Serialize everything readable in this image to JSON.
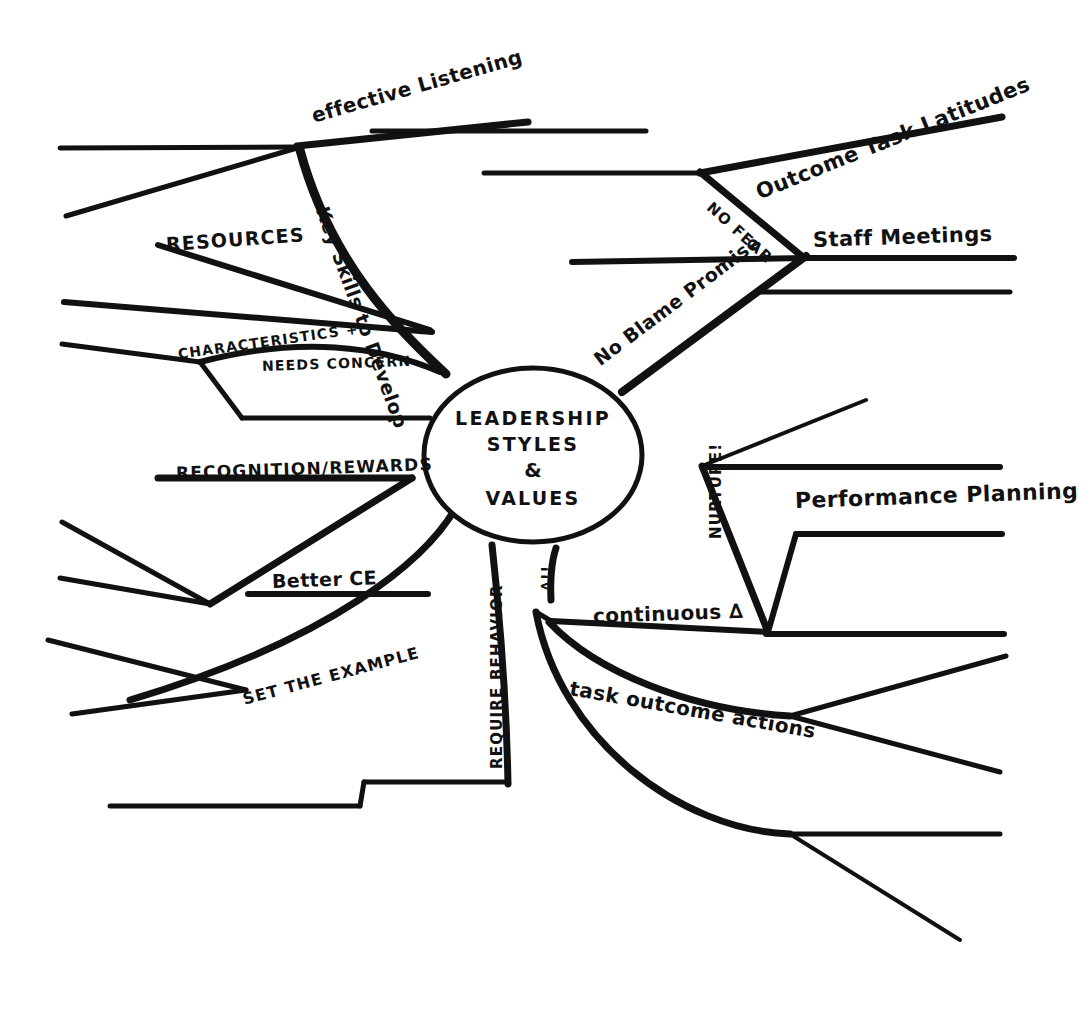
{
  "document": {
    "type": "hand-drawn-mind-map",
    "medium": "black ink on white paper",
    "ink_color": "#111111",
    "background_color": "#ffffff"
  },
  "central_node": {
    "shape": "ellipse",
    "lines": [
      "Leadership",
      "Styles",
      "&",
      "Values"
    ],
    "full_text": "LEADERSHIP STYLES & VALUES"
  },
  "branches": [
    {
      "id": "effective-listening",
      "label": "effective Listening",
      "style": "script",
      "region": "top",
      "x": 312,
      "y": 104,
      "rotate": -16,
      "size": 20
    },
    {
      "id": "key-skills-to-develop",
      "label": "Key Skills to Develop",
      "style": "script",
      "region": "upper-left",
      "x": 322,
      "y": 196,
      "rotate": 70,
      "size": 19
    },
    {
      "id": "resources",
      "label": "Resources",
      "style": "caps",
      "region": "left-upper",
      "x": 166,
      "y": 233,
      "rotate": -4,
      "size": 19
    },
    {
      "id": "characteristics-plus",
      "label": "Characteristics +",
      "style": "caps",
      "region": "left-middle",
      "x": 178,
      "y": 346,
      "rotate": -8,
      "size": 14
    },
    {
      "id": "needs-concern",
      "label": "Needs Concern",
      "style": "caps",
      "region": "left-middle",
      "x": 262,
      "y": 358,
      "rotate": -2,
      "size": 14
    },
    {
      "id": "recognition-rewards",
      "label": "Recognition/Rewards",
      "style": "caps",
      "region": "left-lower",
      "x": 176,
      "y": 473,
      "rotate": -2,
      "size": 17
    },
    {
      "id": "better-ce",
      "label": "Better CE",
      "style": "script",
      "region": "left-lower",
      "x": 272,
      "y": 580,
      "rotate": -2,
      "size": 19
    },
    {
      "id": "set-the-example",
      "label": "Set The Example",
      "style": "caps",
      "region": "bottom-left",
      "x": 243,
      "y": 690,
      "rotate": -15,
      "size": 16
    },
    {
      "id": "require-behavior",
      "label": "Require Behavior",
      "style": "caps",
      "region": "bottom-center",
      "x": 497,
      "y": 740,
      "rotate": -90,
      "size": 15
    },
    {
      "id": "no-fear",
      "label": "No Fear",
      "style": "caps",
      "region": "upper-right",
      "x": 713,
      "y": 200,
      "rotate": 42,
      "size": 15
    },
    {
      "id": "outcome-task-latitudes",
      "label": "Outcome Task Latitudes",
      "style": "script",
      "region": "top-right",
      "x": 757,
      "y": 181,
      "rotate": -22,
      "size": 21
    },
    {
      "id": "staff-meetings",
      "label": "Staff Meetings",
      "style": "script",
      "region": "right-upper",
      "x": 813,
      "y": 238,
      "rotate": -2,
      "size": 21
    },
    {
      "id": "no-blame-promise",
      "label": "No Blame Promise",
      "style": "script",
      "region": "right-middle",
      "x": 596,
      "y": 350,
      "rotate": -37,
      "size": 19
    },
    {
      "id": "nurture",
      "label": "Nurture!",
      "style": "caps",
      "region": "right-center",
      "x": 716,
      "y": 530,
      "rotate": -90,
      "size": 15
    },
    {
      "id": "performance-planning",
      "label": "Performance Planning",
      "style": "script",
      "region": "right-center",
      "x": 795,
      "y": 498,
      "rotate": -2,
      "size": 22
    },
    {
      "id": "delta-emphasis",
      "label": "∆!!",
      "style": "caps",
      "region": "lower-center",
      "x": 551,
      "y": 585,
      "rotate": -90,
      "size": 14
    },
    {
      "id": "continuous-delta",
      "label": "continuous ∆",
      "style": "script",
      "region": "lower-right",
      "x": 593,
      "y": 614,
      "rotate": -2,
      "size": 20
    },
    {
      "id": "task-outcome-actions",
      "label": "task outcome actions",
      "style": "script",
      "region": "lower-right",
      "x": 570,
      "y": 686,
      "rotate": 10,
      "size": 20
    }
  ]
}
